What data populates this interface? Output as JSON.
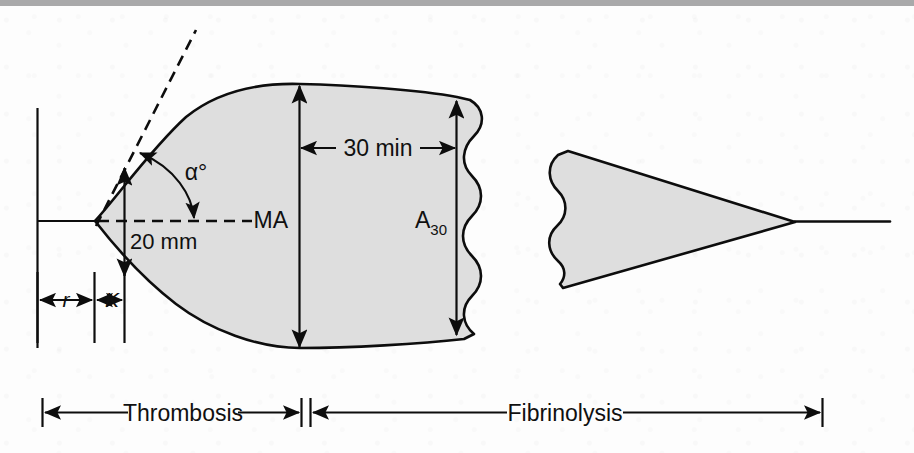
{
  "figure": {
    "background_color": "#fdfdfd",
    "top_band_color": "#a9a9aa",
    "clot_fill_color": "#dedede",
    "line_color": "#0d0d0d"
  },
  "labels": {
    "alpha": "α°",
    "twenty_mm": "20 mm",
    "thirty_min": "30 min",
    "ma": "MA",
    "a30_base": "A",
    "a30_subscript": "30",
    "r": "r",
    "k": "K",
    "thrombosis": "Thrombosis",
    "fibrinolysis": "Fibrinolysis"
  },
  "annotations": [
    {
      "name": "r-interval",
      "label": "r",
      "kind": "horizontal-double-arrow"
    },
    {
      "name": "k-interval",
      "label": "K",
      "kind": "horizontal-double-arrow"
    },
    {
      "name": "alpha-angle",
      "label": "α°",
      "kind": "arc-double-arrow"
    },
    {
      "name": "amplitude-20mm",
      "label": "20 mm",
      "kind": "vertical-double-arrow"
    },
    {
      "name": "maximum-amplitude",
      "label": "MA",
      "kind": "vertical-double-arrow"
    },
    {
      "name": "amplitude-30min",
      "label": "A30",
      "kind": "vertical-double-arrow"
    },
    {
      "name": "interval-30min",
      "label": "30 min",
      "kind": "horizontal-double-arrow"
    },
    {
      "name": "phase-thrombosis",
      "label": "Thrombosis",
      "kind": "horizontal-double-arrow-bar"
    },
    {
      "name": "phase-fibrinolysis",
      "label": "Fibrinolysis",
      "kind": "horizontal-double-arrow-bar"
    }
  ]
}
